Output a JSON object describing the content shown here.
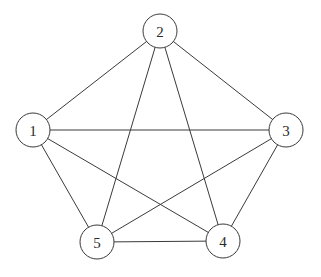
{
  "diagram": {
    "type": "graph",
    "node_radius": 17,
    "nodes": [
      {
        "id": "1",
        "label": "1",
        "x": 33,
        "y": 130
      },
      {
        "id": "2",
        "label": "2",
        "x": 160,
        "y": 31
      },
      {
        "id": "3",
        "label": "3",
        "x": 286,
        "y": 130
      },
      {
        "id": "4",
        "label": "4",
        "x": 223,
        "y": 241
      },
      {
        "id": "5",
        "label": "5",
        "x": 97,
        "y": 242
      }
    ],
    "edges": [
      {
        "from": "1",
        "to": "2"
      },
      {
        "from": "1",
        "to": "3"
      },
      {
        "from": "1",
        "to": "4"
      },
      {
        "from": "1",
        "to": "5"
      },
      {
        "from": "2",
        "to": "3"
      },
      {
        "from": "2",
        "to": "4"
      },
      {
        "from": "2",
        "to": "5"
      },
      {
        "from": "3",
        "to": "4"
      },
      {
        "from": "3",
        "to": "5"
      },
      {
        "from": "4",
        "to": "5"
      }
    ],
    "colors": {
      "stroke": "#3a3a3a",
      "node_fill": "#ffffff",
      "label": "#2a2a2a",
      "background": "#ffffff"
    }
  }
}
